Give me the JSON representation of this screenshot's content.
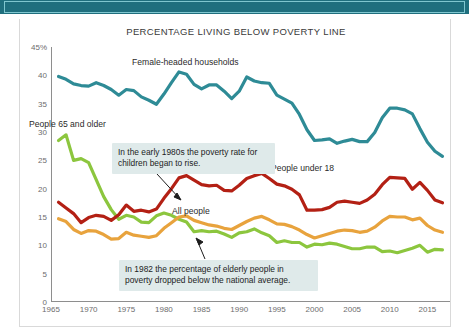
{
  "banner": {
    "name": "top-banner"
  },
  "chart_data": {
    "type": "line",
    "title": "PERCENTAGE LIVING BELOW POVERTY LINE",
    "xlabel": "",
    "ylabel": "",
    "xlim": [
      1965,
      2018
    ],
    "ylim": [
      0,
      45
    ],
    "grid": false,
    "legend_position": "inline-labels",
    "ytick_labels": [
      "0",
      "5",
      "10",
      "15",
      "20",
      "25",
      "30",
      "35",
      "40",
      "45%"
    ],
    "yticks": [
      0,
      5,
      10,
      15,
      20,
      25,
      30,
      35,
      40,
      45
    ],
    "xtick_labels": [
      "1965",
      "1970",
      "1975",
      "1980",
      "1985",
      "1990",
      "1995",
      "2000",
      "2005",
      "2010",
      "2015"
    ],
    "xticks": [
      1965,
      1970,
      1975,
      1980,
      1985,
      1990,
      1995,
      2000,
      2005,
      2010,
      2015
    ],
    "x": [
      1966,
      1967,
      1968,
      1969,
      1970,
      1971,
      1972,
      1973,
      1974,
      1975,
      1976,
      1977,
      1978,
      1979,
      1980,
      1981,
      1982,
      1983,
      1984,
      1985,
      1986,
      1987,
      1988,
      1989,
      1990,
      1991,
      1992,
      1993,
      1994,
      1995,
      1996,
      1997,
      1998,
      1999,
      2000,
      2001,
      2002,
      2003,
      2004,
      2005,
      2006,
      2007,
      2008,
      2009,
      2010,
      2011,
      2012,
      2013,
      2014,
      2015,
      2016,
      2017
    ],
    "series": [
      {
        "name": "Female-headed households",
        "color": "#2e8b96",
        "values": [
          39.8,
          39.3,
          38.5,
          38.2,
          38.1,
          38.7,
          38.2,
          37.5,
          36.5,
          37.5,
          37.3,
          36.2,
          35.6,
          34.9,
          36.7,
          38.7,
          40.6,
          40.2,
          38.4,
          37.6,
          38.3,
          38.3,
          37.2,
          35.9,
          37.2,
          39.7,
          39.0,
          38.7,
          38.6,
          36.5,
          35.8,
          35.1,
          33.1,
          30.4,
          28.5,
          28.6,
          28.8,
          28.0,
          28.4,
          28.7,
          28.3,
          28.3,
          29.9,
          32.5,
          34.2,
          34.2,
          33.9,
          33.2,
          30.6,
          28.2,
          26.6,
          25.7
        ]
      },
      {
        "name": "People 65 and older",
        "color": "#8cc63e",
        "values": [
          28.5,
          29.5,
          25.0,
          25.3,
          24.6,
          21.6,
          18.6,
          16.3,
          14.6,
          15.3,
          15.0,
          14.1,
          14.0,
          15.2,
          15.7,
          15.3,
          14.6,
          14.1,
          12.4,
          12.6,
          12.4,
          12.5,
          12.0,
          11.4,
          12.2,
          12.4,
          12.9,
          12.2,
          11.7,
          10.5,
          10.8,
          10.5,
          10.5,
          9.7,
          10.2,
          10.1,
          10.4,
          10.2,
          9.8,
          9.4,
          9.4,
          9.7,
          9.7,
          8.9,
          9.0,
          8.7,
          9.1,
          9.5,
          10.0,
          8.8,
          9.3,
          9.2
        ]
      },
      {
        "name": "People under 18",
        "color": "#b32014",
        "values": [
          17.6,
          16.6,
          15.6,
          14.0,
          14.9,
          15.3,
          15.1,
          14.4,
          15.4,
          17.1,
          16.0,
          16.2,
          15.9,
          16.4,
          18.3,
          20.0,
          21.9,
          22.3,
          21.5,
          20.7,
          20.5,
          20.6,
          19.7,
          19.6,
          20.6,
          21.8,
          22.3,
          22.7,
          21.8,
          20.8,
          20.5,
          19.9,
          18.9,
          16.2,
          16.2,
          16.3,
          16.7,
          17.6,
          17.8,
          17.6,
          17.4,
          18.0,
          19.0,
          20.7,
          22.0,
          21.9,
          21.8,
          19.9,
          21.1,
          19.7,
          18.0,
          17.5
        ]
      },
      {
        "name": "All people",
        "color": "#e8a33d",
        "values": [
          14.7,
          14.2,
          12.8,
          12.1,
          12.6,
          12.5,
          11.9,
          11.1,
          11.2,
          12.3,
          11.8,
          11.6,
          11.4,
          11.7,
          13.0,
          14.0,
          15.0,
          15.2,
          14.4,
          14.0,
          13.6,
          13.4,
          13.0,
          12.8,
          13.5,
          14.2,
          14.8,
          15.1,
          14.5,
          13.8,
          13.7,
          13.3,
          12.7,
          11.9,
          11.3,
          11.7,
          12.1,
          12.5,
          12.7,
          12.6,
          12.3,
          12.5,
          13.2,
          14.3,
          15.1,
          15.0,
          15.0,
          14.5,
          14.8,
          13.5,
          12.7,
          12.3
        ]
      }
    ],
    "annotations": [
      {
        "id": "children-callout",
        "text": "In the early 1980s the poverty rate for children began to rise.",
        "points_to_series": "People under 18"
      },
      {
        "id": "elderly-callout",
        "text": "In 1982 the percentage of elderly people in poverty dropped below the national average.",
        "points_to_series": "People 65 and older"
      }
    ]
  }
}
